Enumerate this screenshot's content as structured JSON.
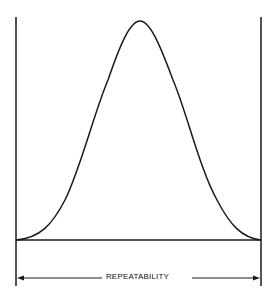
{
  "diagram": {
    "type": "bell-curve",
    "dimension_label": "REPEATABILITY",
    "colors": {
      "line": "#1a1a1a",
      "background": "#ffffff"
    }
  }
}
